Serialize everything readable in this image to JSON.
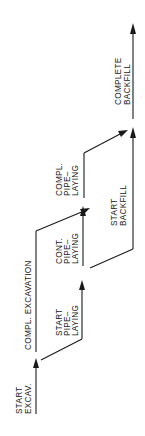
{
  "diagram": {
    "type": "activity-sequence-flow",
    "orientation": "rotated-90-ccw",
    "colors": {
      "line": "#1a1a1a",
      "background": "#ffffff"
    },
    "labels": {
      "start_excav_1": "START",
      "start_excav_2": "EXCAV.",
      "compl_excavation": "COMPL. EXCAVATION",
      "start_pipe_1": "START",
      "start_pipe_2": "PIPE–",
      "start_pipe_3": "LAYING",
      "cont_pipe_1": "CONT.",
      "cont_pipe_2": "PIPE–",
      "cont_pipe_3": "LAYING",
      "compl_pipe_1": "COMPL.",
      "compl_pipe_2": "PIPE–",
      "compl_pipe_3": "LAYING",
      "start_backfill_1": "START",
      "start_backfill_2": "BACKFILL",
      "complete_backfill_1": "COMPLETE",
      "complete_backfill_2": "BACKFILL"
    },
    "activities": [
      {
        "id": "start-excav",
        "label": "START EXCAV."
      },
      {
        "id": "compl-excavation",
        "label": "COMPL. EXCAVATION"
      },
      {
        "id": "start-pipe-laying",
        "label": "START PIPE-LAYING"
      },
      {
        "id": "cont-pipe-laying",
        "label": "CONT. PIPE-LAYING"
      },
      {
        "id": "compl-pipe-laying",
        "label": "COMPL. PIPE-LAYING"
      },
      {
        "id": "start-backfill",
        "label": "START BACKFILL"
      },
      {
        "id": "complete-backfill",
        "label": "COMPLETE BACKFILL"
      }
    ]
  }
}
